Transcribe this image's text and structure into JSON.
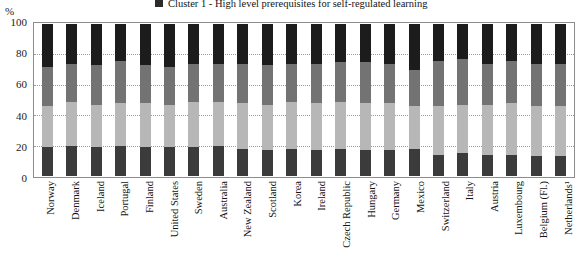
{
  "legend": {
    "swatch_color": "#2b2b2b",
    "label": "Cluster 1 - High level prerequisites for self-regulated learning"
  },
  "axis": {
    "y_unit": "%",
    "y_ticks": [
      "100",
      "80",
      "60",
      "40",
      "20",
      "0"
    ]
  },
  "chart_data": {
    "type": "bar",
    "subtype": "stacked-100-percent",
    "title": "",
    "subtitle": "",
    "xlabel": "",
    "ylabel": "%",
    "ylim": [
      0,
      100
    ],
    "grid": true,
    "legend_position": "top",
    "legend_entries": [
      "Cluster 1 - High level prerequisites for self-regulated learning"
    ],
    "annotations": [
      "1. Netherlands"
    ],
    "colors": {
      "cluster1": "#1c1c1c",
      "cluster2": "#737373",
      "cluster3": "#b7b7b7",
      "cluster4": "#3b3b3b"
    },
    "categories": [
      "Norway",
      "Denmark",
      "Iceland",
      "Portugal",
      "Finland",
      "United States",
      "Sweden",
      "Australia",
      "New Zealand",
      "Scotland",
      "Korea",
      "Ireland",
      "Czech Republic",
      "Hungary",
      "Germany",
      "Mexico",
      "Switzerland",
      "Italy",
      "Austria",
      "Luxembourg",
      "Belgium (Fl.)",
      "Netherlands¹"
    ],
    "series": [
      {
        "name": "Cluster 1 - High level prerequisites for self-regulated learning",
        "color": "#1c1c1c",
        "values": [
          28,
          26,
          27,
          24,
          27,
          28,
          26,
          26,
          26,
          27,
          26,
          26,
          25,
          25,
          26,
          30,
          24,
          23,
          26,
          24,
          26,
          26
        ]
      },
      {
        "name": "Cluster 2",
        "color": "#737373",
        "values": [
          26,
          25,
          26,
          28,
          25,
          25,
          25,
          25,
          26,
          26,
          25,
          26,
          26,
          27,
          26,
          24,
          30,
          30,
          27,
          28,
          28,
          28
        ]
      },
      {
        "name": "Cluster 3",
        "color": "#b7b7b7",
        "values": [
          27,
          29,
          28,
          28,
          29,
          28,
          30,
          29,
          30,
          30,
          31,
          31,
          31,
          31,
          31,
          28,
          32,
          32,
          33,
          34,
          33,
          33
        ]
      },
      {
        "name": "Cluster 4",
        "color": "#3b3b3b",
        "values": [
          19,
          20,
          19,
          20,
          19,
          19,
          19,
          20,
          18,
          17,
          18,
          17,
          18,
          17,
          17,
          18,
          14,
          15,
          14,
          14,
          13,
          13
        ]
      }
    ]
  }
}
